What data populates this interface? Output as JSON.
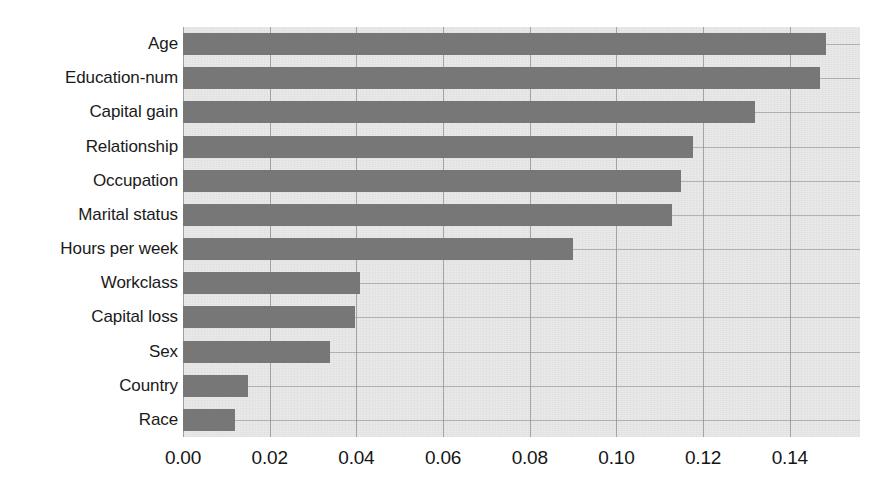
{
  "chart_data": {
    "type": "bar",
    "orientation": "horizontal",
    "title": "",
    "subtitle": "",
    "xlabel": "",
    "ylabel": "",
    "categories": [
      "Age",
      "Education-num",
      "Capital gain",
      "Relationship",
      "Occupation",
      "Marital status",
      "Hours per week",
      "Workclass",
      "Capital loss",
      "Sex",
      "Country",
      "Race"
    ],
    "values": [
      0.1483,
      0.1469,
      0.1319,
      0.1176,
      0.1148,
      0.1128,
      0.0899,
      0.0408,
      0.0396,
      0.0339,
      0.015,
      0.012
    ],
    "xlim": [
      0.0,
      0.1562
    ],
    "ylim": null,
    "xticks": [
      0.0,
      0.02,
      0.04,
      0.06,
      0.08,
      0.1,
      0.12,
      0.14
    ],
    "xtick_labels": [
      "0.00",
      "0.02",
      "0.04",
      "0.06",
      "0.08",
      "0.10",
      "0.12",
      "0.14"
    ],
    "grid": "both",
    "legend": null,
    "colors": {
      "bar": "#777777",
      "plot_background": "#e9e9e9",
      "gridline": "#8c8c8c",
      "page_background": "#ffffff",
      "text": "#1a1a1a"
    }
  }
}
